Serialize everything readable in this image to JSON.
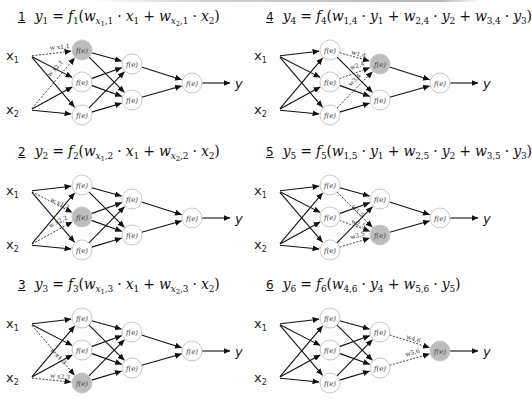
{
  "figure": {
    "node_label": "f(e)",
    "output_label": "y",
    "inputs": [
      "x1",
      "x2"
    ],
    "colors": {
      "highlight_node": "#bdbdbd",
      "node_fill": "#ffffff",
      "node_stroke": "#c8c8c8",
      "edge": "#111111"
    }
  },
  "panels": [
    {
      "number": "1",
      "equation": {
        "lhs": "y1",
        "func": "f1",
        "terms": [
          "w_{x1,1} · x1",
          "w_{x2,1} · x2"
        ]
      },
      "eq_html_parts": {
        "num": "1",
        "y": "y",
        "ysub": "1",
        "f": "f",
        "fsub": "1"
      },
      "highlight": "h1",
      "dashed_edges": [
        {
          "from": "x1",
          "to": "h1",
          "label": "w x1,1"
        },
        {
          "from": "x2",
          "to": "h1",
          "label": "w x2,1"
        }
      ]
    },
    {
      "number": "2",
      "equation": {
        "lhs": "y2",
        "func": "f2",
        "terms": [
          "w_{x1,2} · x1",
          "w_{x2,2} · x2"
        ]
      },
      "eq_html_parts": {
        "num": "2",
        "y": "y",
        "ysub": "2",
        "f": "f",
        "fsub": "2"
      },
      "highlight": "h2",
      "dashed_edges": [
        {
          "from": "x1",
          "to": "h2",
          "label": "w x1,2"
        },
        {
          "from": "x2",
          "to": "h2",
          "label": "w x2,2"
        }
      ]
    },
    {
      "number": "3",
      "equation": {
        "lhs": "y3",
        "func": "f3",
        "terms": [
          "w_{x1,3} · x1",
          "w_{x2,3} · x2"
        ]
      },
      "eq_html_parts": {
        "num": "3",
        "y": "y",
        "ysub": "3",
        "f": "f",
        "fsub": "3"
      },
      "highlight": "h3",
      "dashed_edges": [
        {
          "from": "x1",
          "to": "h3",
          "label": "w x1,3"
        },
        {
          "from": "x2",
          "to": "h3",
          "label": "w x2,3"
        }
      ]
    },
    {
      "number": "4",
      "equation": {
        "lhs": "y4",
        "func": "f4",
        "terms": [
          "w_{1,4} · y1",
          "w_{2,4} · y2",
          "w_{3,4} · y3"
        ]
      },
      "eq_html_parts": {
        "num": "4",
        "y": "y",
        "ysub": "4",
        "f": "f",
        "fsub": "4"
      },
      "highlight": "g1",
      "dashed_edges": [
        {
          "from": "h1",
          "to": "g1",
          "label": "w1,4"
        },
        {
          "from": "h2",
          "to": "g1",
          "label": "w2,4"
        },
        {
          "from": "h3",
          "to": "g1",
          "label": "w3,4"
        }
      ]
    },
    {
      "number": "5",
      "equation": {
        "lhs": "y5",
        "func": "f5",
        "terms": [
          "w_{1,5} · y1",
          "w_{2,5} · y2",
          "w_{3,5} · y3"
        ]
      },
      "eq_html_parts": {
        "num": "5",
        "y": "y",
        "ysub": "5",
        "f": "f",
        "fsub": "5"
      },
      "highlight": "g2",
      "dashed_edges": [
        {
          "from": "h1",
          "to": "g2",
          "label": "w1,5"
        },
        {
          "from": "h2",
          "to": "g2",
          "label": "w2,5"
        },
        {
          "from": "h3",
          "to": "g2",
          "label": "w3,5"
        }
      ]
    },
    {
      "number": "6",
      "equation": {
        "lhs": "y6",
        "func": "f6",
        "terms": [
          "w_{4,6} · y4",
          "w_{5,6} · y5"
        ]
      },
      "eq_html_parts": {
        "num": "6",
        "y": "y",
        "ysub": "6",
        "f": "f",
        "fsub": "6"
      },
      "highlight": "o",
      "dashed_edges": [
        {
          "from": "g1",
          "to": "o",
          "label": "w4,6"
        },
        {
          "from": "g2",
          "to": "o",
          "label": "w5,6"
        }
      ]
    }
  ],
  "equation_text": {
    "p1": {
      "a": "w",
      "a1": "x",
      "a1s": "1",
      "a2": ",1",
      "xa": "x",
      "xas": "1",
      "b": "w",
      "b1": "x",
      "b1s": "2",
      "b2": ",1",
      "xb": "x",
      "xbs": "2"
    },
    "p2": {
      "a": "w",
      "a1": "x",
      "a1s": "1",
      "a2": ",2",
      "xa": "x",
      "xas": "1",
      "b": "w",
      "b1": "x",
      "b1s": "2",
      "b2": ",2",
      "xb": "x",
      "xbs": "2"
    },
    "p3": {
      "a": "w",
      "a1": "x",
      "a1s": "1",
      "a2": ",3",
      "xa": "x",
      "xas": "1",
      "b": "w",
      "b1": "x",
      "b1s": "2",
      "b2": ",3",
      "xb": "x",
      "xbs": "2"
    },
    "p4": {
      "a": "w",
      "as": "1,4",
      "ya": "y",
      "yas": "1",
      "b": "w",
      "bs": "2,4",
      "yb": "y",
      "ybs": "2",
      "c": "w",
      "cs": "3,4",
      "yc": "y",
      "ycs": "3"
    },
    "p5": {
      "a": "w",
      "as": "1,5",
      "ya": "y",
      "yas": "1",
      "b": "w",
      "bs": "2,5",
      "yb": "y",
      "ybs": "2",
      "c": "w",
      "cs": "3,5",
      "yc": "y",
      "ycs": "3"
    },
    "p6": {
      "a": "w",
      "as": "4,6",
      "ya": "y",
      "yas": "4",
      "b": "w",
      "bs": "5,6",
      "yb": "y",
      "ybs": "5"
    }
  },
  "symbols": {
    "eq": "=",
    "plus": "+",
    "dot": "·",
    "lparen": "(",
    "rparen": ")",
    "x": "x",
    "s1": "1",
    "s2": "2"
  }
}
